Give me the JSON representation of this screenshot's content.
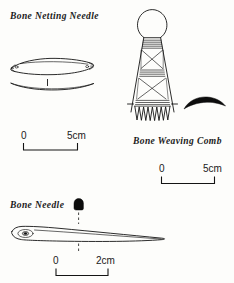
{
  "page": {
    "kind": "archaeological-artefact-illustration-plate",
    "background_color": "#fdfdfb",
    "ink_color": "#141414"
  },
  "figures": [
    {
      "id": "bone-netting-needle",
      "label": "Bone Netting Needle",
      "views": [
        "plan",
        "side-profile"
      ],
      "description": "Elongated lens-shaped needle with notched perforated terminals",
      "scale": {
        "zero_label": "0",
        "end_label": "5cm"
      }
    },
    {
      "id": "bone-weaving-comb",
      "label": "Bone Weaving Comb",
      "views": [
        "face",
        "cross-section"
      ],
      "description": "Tapering comb with rounded perforated head, banded and cross-hatched decoration, and sawtooth teeth",
      "scale": {
        "zero_label": "0",
        "end_label": "5cm"
      }
    },
    {
      "id": "bone-needle",
      "label": "Bone Needle",
      "views": [
        "plan",
        "cross-section"
      ],
      "description": "Tapering needle with oval eye at the broad end",
      "scale": {
        "zero_label": "0",
        "end_label": "2cm"
      }
    }
  ],
  "labels": {
    "netting_needle": "Bone Netting Needle",
    "weaving_comb": "Bone Weaving Comb",
    "needle": "Bone Needle"
  },
  "scales": {
    "netting_needle": {
      "zero": "0",
      "end": "5cm"
    },
    "weaving_comb": {
      "zero": "0",
      "end": "5cm"
    },
    "needle": {
      "zero": "0",
      "end": "2cm"
    }
  }
}
